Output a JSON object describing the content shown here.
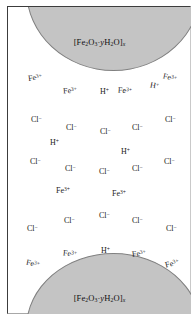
{
  "figure": {
    "background_color": "#ffffff",
    "oxide_fill_color": "#c4c4c4",
    "oxide_stroke_color": "#808080",
    "text_color": "#1a1a1a",
    "frame_border_color": "#3c3c3c"
  },
  "oxide_masses": [
    {
      "id": "oxide-top",
      "position": "top",
      "formula_parts": {
        "open": "[Fe",
        "sub1": "2",
        "element2": "O",
        "sub2": "3",
        "middot": "·",
        "ital_y": "y",
        "element3": "H",
        "sub3": "2",
        "element4": "O",
        "close": "]",
        "sub_x": "x"
      },
      "formula_plain": "[Fe2O3·yH2O]x"
    },
    {
      "id": "oxide-bottom",
      "position": "bottom",
      "formula_parts": {
        "open": "[Fe",
        "sub1": "2",
        "element2": "O",
        "sub2": "3",
        "middot": "·",
        "ital_y": "y",
        "element3": "H",
        "sub3": "2",
        "element4": "O",
        "close": "]",
        "sub_x": "x"
      },
      "formula_plain": "[Fe2O3·yH2O]x"
    }
  ],
  "ions": [
    {
      "id": "ion-01",
      "species": "Fe",
      "charge": "3+",
      "x": 20,
      "y": 66,
      "rot": -8
    },
    {
      "id": "ion-02",
      "species": "Fe",
      "charge": "3+",
      "x": 55,
      "y": 79,
      "rot": -4
    },
    {
      "id": "ion-03",
      "species": "H",
      "charge": "+",
      "x": 92,
      "y": 80,
      "rot": 0
    },
    {
      "id": "ion-04",
      "species": "Fe",
      "charge": "3+",
      "x": 110,
      "y": 79,
      "rot": 4
    },
    {
      "id": "ion-05",
      "species": "H",
      "charge": "+",
      "x": 142,
      "y": 74,
      "rot": 10
    },
    {
      "id": "ion-06",
      "species": "Fe",
      "charge": "3+",
      "x": 155,
      "y": 66,
      "rot": 14
    },
    {
      "id": "ion-07",
      "species": "Cl",
      "charge": "−",
      "x": 23,
      "y": 108,
      "rot": 0
    },
    {
      "id": "ion-08",
      "species": "Cl",
      "charge": "−",
      "x": 58,
      "y": 116,
      "rot": 0
    },
    {
      "id": "ion-09",
      "species": "Cl",
      "charge": "−",
      "x": 92,
      "y": 120,
      "rot": 0
    },
    {
      "id": "ion-10",
      "species": "Cl",
      "charge": "−",
      "x": 124,
      "y": 116,
      "rot": 0
    },
    {
      "id": "ion-11",
      "species": "Cl",
      "charge": "−",
      "x": 157,
      "y": 108,
      "rot": 0
    },
    {
      "id": "ion-12",
      "species": "H",
      "charge": "+",
      "x": 42,
      "y": 131,
      "rot": 0
    },
    {
      "id": "ion-13",
      "species": "H",
      "charge": "+",
      "x": 113,
      "y": 140,
      "rot": 0
    },
    {
      "id": "ion-14",
      "species": "Cl",
      "charge": "−",
      "x": 22,
      "y": 150,
      "rot": 0
    },
    {
      "id": "ion-15",
      "species": "Cl",
      "charge": "−",
      "x": 57,
      "y": 157,
      "rot": 0
    },
    {
      "id": "ion-16",
      "species": "Cl",
      "charge": "−",
      "x": 91,
      "y": 160,
      "rot": 0
    },
    {
      "id": "ion-17",
      "species": "Cl",
      "charge": "−",
      "x": 124,
      "y": 157,
      "rot": 0
    },
    {
      "id": "ion-18",
      "species": "Cl",
      "charge": "−",
      "x": 156,
      "y": 150,
      "rot": 0
    },
    {
      "id": "ion-19",
      "species": "Fe",
      "charge": "3+",
      "x": 48,
      "y": 179,
      "rot": 0
    },
    {
      "id": "ion-20",
      "species": "Fe",
      "charge": "3+",
      "x": 104,
      "y": 182,
      "rot": 0
    },
    {
      "id": "ion-21",
      "species": "Cl",
      "charge": "−",
      "x": 19,
      "y": 217,
      "rot": 0
    },
    {
      "id": "ion-22",
      "species": "Cl",
      "charge": "−",
      "x": 56,
      "y": 209,
      "rot": 0
    },
    {
      "id": "ion-23",
      "species": "Cl",
      "charge": "−",
      "x": 91,
      "y": 204,
      "rot": 0
    },
    {
      "id": "ion-24",
      "species": "Cl",
      "charge": "−",
      "x": 124,
      "y": 209,
      "rot": 0
    },
    {
      "id": "ion-25",
      "species": "Cl",
      "charge": "−",
      "x": 158,
      "y": 217,
      "rot": 0
    },
    {
      "id": "ion-26",
      "species": "Fe",
      "charge": "3+",
      "x": 18,
      "y": 252,
      "rot": 12
    },
    {
      "id": "ion-27",
      "species": "Fe",
      "charge": "3+",
      "x": 55,
      "y": 242,
      "rot": 6
    },
    {
      "id": "ion-28",
      "species": "H",
      "charge": "+",
      "x": 93,
      "y": 239,
      "rot": 0
    },
    {
      "id": "ion-29",
      "species": "Fe",
      "charge": "3+",
      "x": 124,
      "y": 242,
      "rot": -7
    },
    {
      "id": "ion-30",
      "species": "Fe",
      "charge": "3+",
      "x": 157,
      "y": 252,
      "rot": -14
    }
  ]
}
